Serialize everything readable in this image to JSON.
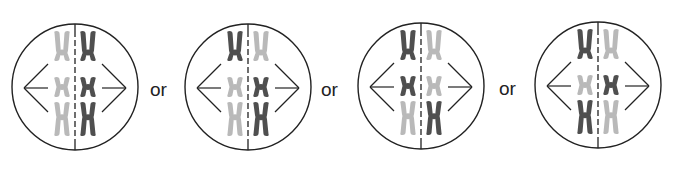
{
  "figure": {
    "separator_text": "or",
    "colors": {
      "light": "#b9b9b9",
      "dark": "#4f4f4f",
      "line": "#222222"
    },
    "cells": [
      {
        "cx": 75,
        "cy": 87,
        "r": 63,
        "left": [
          "light",
          "light",
          "light"
        ],
        "right": [
          "dark",
          "dark",
          "dark"
        ]
      },
      {
        "cx": 248,
        "cy": 87,
        "r": 63,
        "left": [
          "dark",
          "light",
          "light"
        ],
        "right": [
          "light",
          "dark",
          "dark"
        ]
      },
      {
        "cx": 421,
        "cy": 86,
        "r": 63,
        "left": [
          "dark",
          "dark",
          "light"
        ],
        "right": [
          "light",
          "light",
          "dark"
        ]
      },
      {
        "cx": 598,
        "cy": 85,
        "r": 63,
        "left": [
          "dark",
          "light",
          "dark"
        ],
        "right": [
          "light",
          "dark",
          "light"
        ]
      }
    ],
    "separators": [
      {
        "x": 150,
        "y": 80
      },
      {
        "x": 321,
        "y": 80
      },
      {
        "x": 499,
        "y": 79
      }
    ]
  }
}
